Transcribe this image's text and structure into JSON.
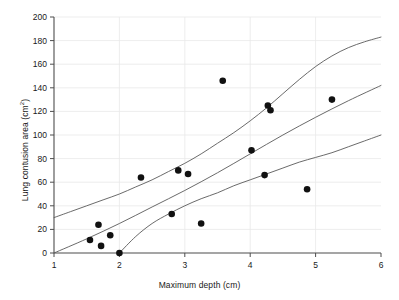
{
  "chart_data": {
    "type": "scatter",
    "title": "",
    "xlabel": "Maximum depth (cm)",
    "ylabel_main": "Lung contusion area (cm",
    "ylabel_sup": "2",
    "ylabel_tail": ")",
    "xlim": [
      1,
      6
    ],
    "ylim": [
      0,
      200
    ],
    "xticks": [
      1,
      2,
      3,
      4,
      5,
      6
    ],
    "yticks": [
      0,
      20,
      40,
      60,
      80,
      100,
      120,
      140,
      160,
      180,
      200
    ],
    "xtick_labels": [
      "1",
      "2",
      "3",
      "4",
      "5",
      "6"
    ],
    "ytick_labels": [
      "0",
      "20",
      "40",
      "60",
      "80",
      "100",
      "120",
      "140",
      "160",
      "180",
      "200"
    ],
    "grid": true,
    "grid_axis": "y",
    "legend": "none",
    "marker": "filled-circle",
    "marker_color": "#111111",
    "marker_size_px": 4.2,
    "points": [
      {
        "x": 1.55,
        "y": 11
      },
      {
        "x": 1.68,
        "y": 24
      },
      {
        "x": 1.72,
        "y": 6
      },
      {
        "x": 1.86,
        "y": 15
      },
      {
        "x": 2.0,
        "y": 0
      },
      {
        "x": 2.33,
        "y": 64
      },
      {
        "x": 2.8,
        "y": 33
      },
      {
        "x": 2.9,
        "y": 70
      },
      {
        "x": 3.05,
        "y": 67
      },
      {
        "x": 3.25,
        "y": 25
      },
      {
        "x": 3.58,
        "y": 146
      },
      {
        "x": 4.02,
        "y": 87
      },
      {
        "x": 4.22,
        "y": 66
      },
      {
        "x": 4.27,
        "y": 125
      },
      {
        "x": 4.31,
        "y": 121
      },
      {
        "x": 4.87,
        "y": 54
      },
      {
        "x": 5.25,
        "y": 130
      }
    ],
    "curves": [
      {
        "name": "upper-confidence-band",
        "color": "#595959",
        "width_px": 0.9,
        "points": [
          {
            "x": 1.0,
            "y": 30
          },
          {
            "x": 1.25,
            "y": 35
          },
          {
            "x": 1.5,
            "y": 40
          },
          {
            "x": 1.75,
            "y": 45
          },
          {
            "x": 2.0,
            "y": 50
          },
          {
            "x": 2.25,
            "y": 56
          },
          {
            "x": 2.5,
            "y": 62
          },
          {
            "x": 2.75,
            "y": 69
          },
          {
            "x": 3.0,
            "y": 76
          },
          {
            "x": 3.25,
            "y": 84
          },
          {
            "x": 3.5,
            "y": 93
          },
          {
            "x": 3.75,
            "y": 102
          },
          {
            "x": 4.0,
            "y": 112
          },
          {
            "x": 4.25,
            "y": 123
          },
          {
            "x": 4.5,
            "y": 135
          },
          {
            "x": 4.75,
            "y": 147
          },
          {
            "x": 5.0,
            "y": 158
          },
          {
            "x": 5.25,
            "y": 167
          },
          {
            "x": 5.5,
            "y": 174
          },
          {
            "x": 5.75,
            "y": 179
          },
          {
            "x": 6.0,
            "y": 183
          }
        ]
      },
      {
        "name": "regression-line",
        "color": "#595959",
        "width_px": 0.9,
        "points": [
          {
            "x": 1.0,
            "y": 0
          },
          {
            "x": 1.5,
            "y": 12
          },
          {
            "x": 2.0,
            "y": 25
          },
          {
            "x": 2.5,
            "y": 39
          },
          {
            "x": 3.0,
            "y": 53
          },
          {
            "x": 3.5,
            "y": 68
          },
          {
            "x": 4.0,
            "y": 84
          },
          {
            "x": 4.5,
            "y": 100
          },
          {
            "x": 5.0,
            "y": 115
          },
          {
            "x": 5.5,
            "y": 129
          },
          {
            "x": 6.0,
            "y": 142
          }
        ]
      },
      {
        "name": "lower-confidence-band",
        "color": "#595959",
        "width_px": 0.9,
        "points": [
          {
            "x": 2.0,
            "y": 0
          },
          {
            "x": 2.25,
            "y": 14
          },
          {
            "x": 2.5,
            "y": 25
          },
          {
            "x": 2.75,
            "y": 33
          },
          {
            "x": 3.0,
            "y": 40
          },
          {
            "x": 3.25,
            "y": 46
          },
          {
            "x": 3.5,
            "y": 51
          },
          {
            "x": 3.75,
            "y": 57
          },
          {
            "x": 4.0,
            "y": 62
          },
          {
            "x": 4.25,
            "y": 67
          },
          {
            "x": 4.5,
            "y": 72
          },
          {
            "x": 4.75,
            "y": 77
          },
          {
            "x": 5.0,
            "y": 81
          },
          {
            "x": 5.25,
            "y": 85
          },
          {
            "x": 5.5,
            "y": 90
          },
          {
            "x": 5.75,
            "y": 95
          },
          {
            "x": 6.0,
            "y": 100
          }
        ]
      }
    ]
  },
  "axes_style": {
    "axis_color": "#4d4d4d",
    "grid_color": "#e9e9e9",
    "tick_label_color": "#1a1a1a",
    "tick_label_size_px": 8.5
  }
}
